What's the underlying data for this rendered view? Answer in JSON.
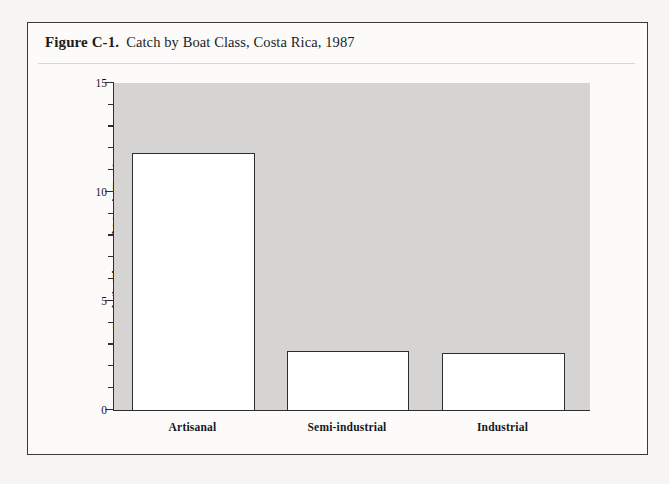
{
  "figure": {
    "number": "Figure C-1.",
    "caption": "Catch by Boat Class, Costa Rica, 1987"
  },
  "chart_data": {
    "type": "bar",
    "title": "Catch by Boat Class, Costa Rica, 1987",
    "categories": [
      "Artisanal",
      "Semi-industrial",
      "Industrial"
    ],
    "values": [
      11.8,
      2.7,
      2.6
    ],
    "xlabel": "",
    "ylabel": "Catch (in Thousand Metric Tons)",
    "ylim": [
      0,
      15
    ],
    "ytick_labels": [
      "0",
      "5",
      "10",
      "15"
    ],
    "ytick_values": [
      0,
      5,
      10,
      15
    ],
    "yminor_step": 1,
    "grid": false,
    "legend": null,
    "plot_background_color": "#d5d4d3",
    "bar_fill_color": "#ffffff",
    "bar_edge_color": "#2e2e30"
  }
}
